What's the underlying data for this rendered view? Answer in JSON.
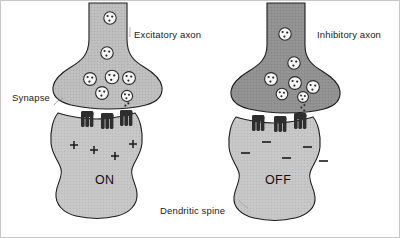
{
  "figure": {
    "background_color": "#ffffff",
    "border_color": "#c8c8c8",
    "width": 400,
    "height": 238
  },
  "labels": {
    "excitatory_axon": "Excitatory axon",
    "inhibitory_axon": "Inhibitory axon",
    "synapse": "Synapse",
    "dendritic_spine": "Dendritic spine",
    "state_on": "ON",
    "state_off": "OFF"
  },
  "colors": {
    "excitatory_axon_fill": "#b9b9b9",
    "inhibitory_axon_fill": "#8f8f8f",
    "spine_fill": "#c4c4c4",
    "vesicle_fill": "#f4f4f4",
    "vesicle_stroke": "#2b2b2b",
    "receptor_fill": "#2e2e2e",
    "outline": "#1e1e1e",
    "text": "#1a1a1a",
    "charge_color": "#1a1a1a"
  },
  "panels": [
    {
      "id": "left",
      "axon_label": "Excitatory axon",
      "state": "ON",
      "charge_symbol": "+",
      "charge_count": 4,
      "vesicle_count": 7,
      "receptor_count": 3,
      "axon_shade": "light"
    },
    {
      "id": "right",
      "axon_label": "Inhibitory axon",
      "state": "OFF",
      "charge_symbol": "−",
      "charge_count": 5,
      "vesicle_count": 7,
      "receptor_count": 3,
      "axon_shade": "dark"
    }
  ],
  "left_panel": {
    "vesicles": [
      {
        "cx": 109,
        "cy": 17,
        "r": 6.2
      },
      {
        "cx": 106,
        "cy": 52,
        "r": 6.2
      },
      {
        "cx": 89,
        "cy": 78,
        "r": 6.4
      },
      {
        "cx": 111,
        "cy": 76,
        "r": 6.8
      },
      {
        "cx": 128,
        "cy": 77,
        "r": 6.4
      },
      {
        "cx": 101,
        "cy": 92,
        "r": 6.4
      },
      {
        "cx": 126,
        "cy": 95,
        "r": 5.6
      }
    ],
    "charges": [
      {
        "x": 73,
        "y": 144
      },
      {
        "x": 93,
        "y": 149
      },
      {
        "x": 114,
        "y": 155
      },
      {
        "x": 132,
        "y": 143
      }
    ],
    "receptors": [
      {
        "x": 84,
        "y": 112
      },
      {
        "x": 104,
        "y": 114
      },
      {
        "x": 123,
        "y": 111
      }
    ]
  },
  "right_panel": {
    "vesicles": [
      {
        "cx": 284,
        "cy": 33,
        "r": 6.2
      },
      {
        "cx": 293,
        "cy": 62,
        "r": 6.2
      },
      {
        "cx": 270,
        "cy": 78,
        "r": 6.4
      },
      {
        "cx": 294,
        "cy": 82,
        "r": 6.4
      },
      {
        "cx": 312,
        "cy": 86,
        "r": 6.4
      },
      {
        "cx": 281,
        "cy": 93,
        "r": 5.8
      },
      {
        "cx": 302,
        "cy": 96,
        "r": 5.4
      }
    ],
    "charges": [
      {
        "x": 244,
        "y": 152
      },
      {
        "x": 265,
        "y": 141
      },
      {
        "x": 285,
        "y": 157
      },
      {
        "x": 306,
        "y": 146
      },
      {
        "x": 322,
        "y": 160
      }
    ],
    "receptors": [
      {
        "x": 255,
        "y": 116
      },
      {
        "x": 277,
        "y": 117
      },
      {
        "x": 297,
        "y": 114
      }
    ]
  }
}
